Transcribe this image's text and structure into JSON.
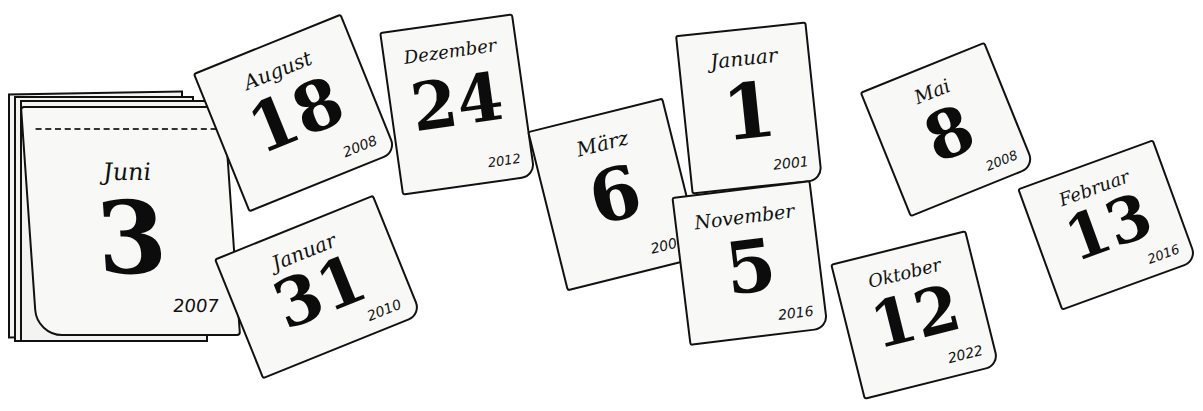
{
  "illustration": {
    "subject": "tear-off calendar pages",
    "ink_color": "#111111",
    "paper_color": "#f8f8f6",
    "background_color": "#ffffff"
  },
  "calendar_block": {
    "month": "Juni",
    "day": "3",
    "year": "2007"
  },
  "pages": [
    {
      "month": "August",
      "day": "18",
      "year": "2008"
    },
    {
      "month": "Januar",
      "day": "31",
      "year": "2010"
    },
    {
      "month": "Dezember",
      "day": "24",
      "year": "2012"
    },
    {
      "month": "März",
      "day": "6",
      "year": "2009"
    },
    {
      "month": "Januar",
      "day": "1",
      "year": "2001"
    },
    {
      "month": "November",
      "day": "5",
      "year": "2016"
    },
    {
      "month": "Mai",
      "day": "8",
      "year": "2008"
    },
    {
      "month": "Oktober",
      "day": "12",
      "year": "2022"
    },
    {
      "month": "Februar",
      "day": "13",
      "year": "2016"
    }
  ]
}
